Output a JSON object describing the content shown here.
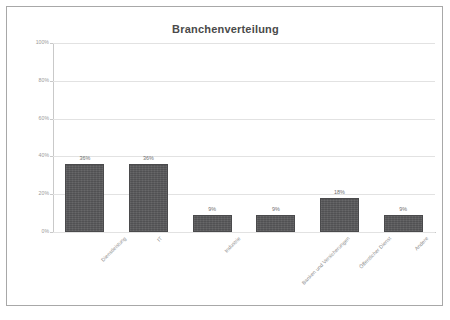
{
  "chart": {
    "title": "Branchenverteilung",
    "bar_color": "#58585a",
    "bar_border_color": "#4a4a4c",
    "grid_color": "#e2e2e2",
    "axis_color": "#c9c9c9",
    "label_color": "#8f8f8f",
    "frame_color": "#a8a8a8",
    "background": "#ffffff"
  },
  "chart_data": {
    "type": "bar",
    "title": "Branchenverteilung",
    "xlabel": "",
    "ylabel": "",
    "ylim": [
      0,
      100
    ],
    "yticks": [
      0,
      20,
      40,
      60,
      80,
      100
    ],
    "ytick_labels": [
      "0%",
      "20%",
      "40%",
      "60%",
      "80%",
      "100%"
    ],
    "grid": true,
    "grid_axis": "y",
    "legend": false,
    "value_labels": true,
    "value_label_suffix": "%",
    "xtick_rotation": -45,
    "categories": [
      "Dienstleistung",
      "IT",
      "Industrie",
      "Banken und Versicherungen",
      "Öffentlicher Dienst",
      "Andere"
    ],
    "values": [
      36,
      36,
      9,
      9,
      18,
      9
    ],
    "data_labels": [
      "36%",
      "36%",
      "9%",
      "9%",
      "18%",
      "9%"
    ]
  }
}
